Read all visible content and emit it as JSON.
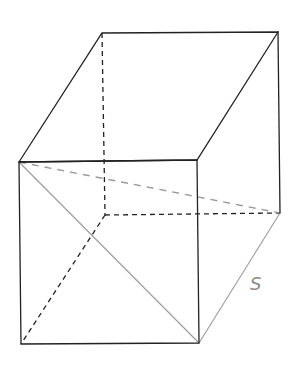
{
  "figure": {
    "type": "3d-box-diagram",
    "vertices": {
      "front_top_left": [
        19,
        162
      ],
      "front_top_right": [
        197,
        160
      ],
      "front_bottom_left": [
        21,
        344
      ],
      "front_bottom_right": [
        199,
        343
      ],
      "back_top_left": [
        102,
        33
      ],
      "back_top_right": [
        278,
        32
      ],
      "back_bottom_left": [
        105,
        215
      ],
      "back_bottom_right": [
        280,
        213
      ]
    },
    "labels": {
      "side": "S"
    },
    "colors": {
      "edge": "#222222",
      "highlight": "#9a9a9a",
      "label": "#8a8a8a"
    }
  }
}
